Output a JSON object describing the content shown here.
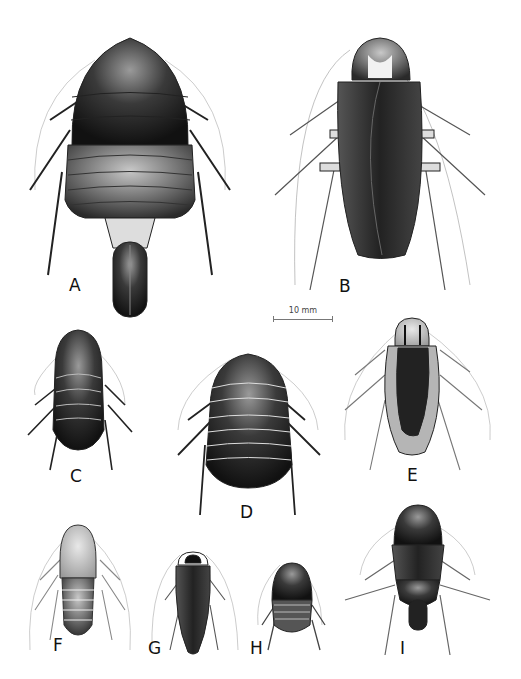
{
  "plate": {
    "subject": "cockroach species illustrations",
    "specimens": [
      {
        "label": "A"
      },
      {
        "label": "B"
      },
      {
        "label": "C"
      },
      {
        "label": "D"
      },
      {
        "label": "E"
      },
      {
        "label": "F"
      },
      {
        "label": "G"
      },
      {
        "label": "H"
      },
      {
        "label": "I"
      }
    ],
    "scale_bar": {
      "text": "10 mm"
    }
  }
}
